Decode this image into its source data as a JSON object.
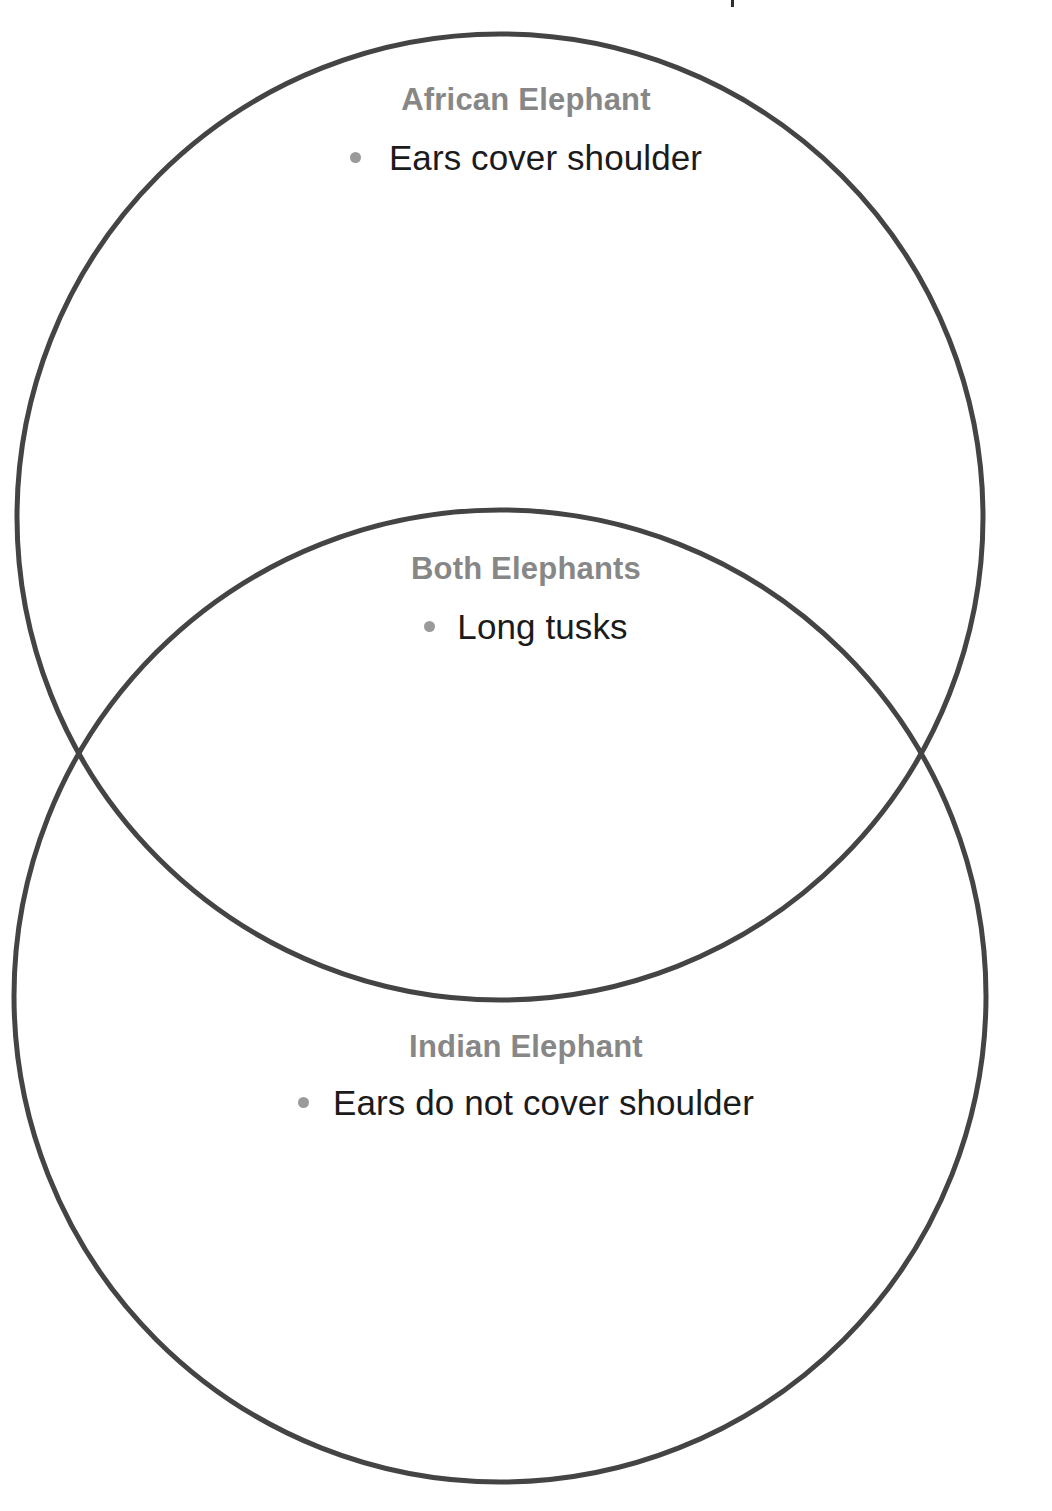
{
  "diagram": {
    "type": "venn",
    "title_artifact": "",
    "stroke_color": "#444444",
    "heading_color": "#878787",
    "body_color": "#1b1b1b",
    "bullet_color": "#9a9a9a",
    "background": "#ffffff"
  },
  "regions": {
    "left_only": {
      "id": "african-elephant",
      "title": "African Elephant",
      "items": [
        "Ears cover shoulder"
      ]
    },
    "intersection": {
      "id": "both-elephants",
      "title": "Both Elephants",
      "items": [
        "Long tusks"
      ]
    },
    "right_only": {
      "id": "indian-elephant",
      "title": "Indian Elephant",
      "items": [
        "Ears do not cover shoulder"
      ]
    }
  },
  "geometry": {
    "circle_top": {
      "cx": 500,
      "cy": 517,
      "r": 483
    },
    "circle_bottom": {
      "cx": 500,
      "cy": 996,
      "r": 486
    }
  }
}
